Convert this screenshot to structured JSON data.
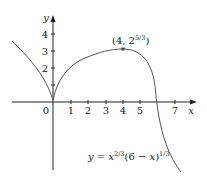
{
  "figure": {
    "function_label": "y = x^(2/3)(6 − x)^(1/3)",
    "equation": {
      "lhs": "y",
      "eq": " = ",
      "x": "x",
      "exp1": "2/3",
      "mid": "(6 − ",
      "x2": "x",
      "close": ")",
      "exp2": "1/3"
    },
    "axis_labels": {
      "x": "x",
      "y": "y"
    },
    "origin_label": "0",
    "x_ticks": [
      "1",
      "2",
      "3",
      "4",
      "5",
      "7"
    ],
    "y_ticks": [
      "2",
      "3",
      "4"
    ],
    "point": {
      "label_pre": "(4, 2",
      "label_exp": "5/3",
      "label_post": ")",
      "x": 4,
      "y": 3.175
    },
    "colors": {
      "curve": "#555555",
      "axes": "#222222"
    }
  }
}
